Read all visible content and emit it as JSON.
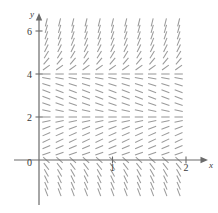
{
  "figure": {
    "kind": "slope-field",
    "axis_color": "#6b6b6b",
    "segment_color": "#9a9a9a",
    "label_color": "#3a3a3a",
    "x_axis_label": "x",
    "y_axis_label": "y"
  },
  "axes": {
    "x_ticks": [
      {
        "label": "0",
        "value": 0
      },
      {
        "label": "1",
        "value": 1
      },
      {
        "label": "2",
        "value": 2
      }
    ],
    "y_ticks": [
      {
        "label": "0",
        "value": 0
      },
      {
        "label": "2",
        "value": 2
      },
      {
        "label": "4",
        "value": 4
      },
      {
        "label": "6",
        "value": 6
      }
    ]
  },
  "chart_data": {
    "type": "scatter",
    "title": "",
    "xlabel": "x",
    "ylabel": "y",
    "xlim": [
      -0.15,
      2.2
    ],
    "ylim": [
      -1.7,
      6.6
    ],
    "grid": false,
    "legend": null,
    "x_ticks": [
      0,
      1,
      2
    ],
    "y_ticks": [
      0,
      2,
      4,
      6
    ],
    "x_tick_labels": [
      "0",
      "1",
      "2"
    ],
    "y_tick_labels": [
      "0",
      "2",
      "4",
      "6"
    ],
    "equilibria": [
      2,
      4
    ],
    "sample_x": [
      0.1,
      0.28,
      0.46,
      0.64,
      0.82,
      1.0,
      1.18,
      1.36,
      1.54,
      1.72,
      1.9
    ],
    "sample_y": [
      -1.5,
      -1.2,
      -0.9,
      -0.6,
      -0.3,
      0.0,
      0.3,
      0.6,
      0.9,
      1.2,
      1.5,
      1.8,
      2.0,
      2.3,
      2.6,
      2.9,
      3.2,
      3.5,
      3.8,
      4.0,
      4.3,
      4.6,
      4.9,
      5.2,
      5.5,
      5.8,
      6.1,
      6.4
    ],
    "slope_by_y": [
      {
        "y": -1.5,
        "slope": -9.0
      },
      {
        "y": -1.2,
        "slope": -8.0
      },
      {
        "y": -0.9,
        "slope": -7.0
      },
      {
        "y": -0.6,
        "slope": -6.0
      },
      {
        "y": -0.3,
        "slope": -4.5
      },
      {
        "y": 0.0,
        "slope": -3.0
      },
      {
        "y": 0.3,
        "slope": 1.2
      },
      {
        "y": 0.6,
        "slope": 1.5
      },
      {
        "y": 0.9,
        "slope": 1.6
      },
      {
        "y": 1.2,
        "slope": 1.5
      },
      {
        "y": 1.5,
        "slope": 1.2
      },
      {
        "y": 1.8,
        "slope": 0.7
      },
      {
        "y": 2.0,
        "slope": 0.0
      },
      {
        "y": 2.3,
        "slope": -0.7
      },
      {
        "y": 2.6,
        "slope": -1.1
      },
      {
        "y": 2.9,
        "slope": -1.3
      },
      {
        "y": 3.2,
        "slope": -1.3
      },
      {
        "y": 3.5,
        "slope": -1.1
      },
      {
        "y": 3.8,
        "slope": -0.6
      },
      {
        "y": 4.0,
        "slope": 0.0
      },
      {
        "y": 4.3,
        "slope": 2.5
      },
      {
        "y": 4.6,
        "slope": 4.0
      },
      {
        "y": 4.9,
        "slope": 5.5
      },
      {
        "y": 5.2,
        "slope": 7.0
      },
      {
        "y": 5.5,
        "slope": 8.5
      },
      {
        "y": 5.8,
        "slope": 10.0
      },
      {
        "y": 6.1,
        "slope": 12.0
      },
      {
        "y": 6.4,
        "slope": 14.0
      }
    ]
  }
}
